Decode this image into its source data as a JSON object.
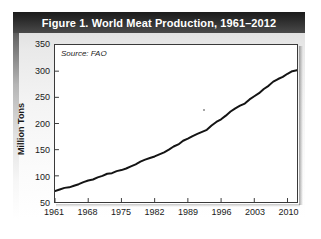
{
  "figure": {
    "title": "Figure 1. World Meat Production, 1961–2012",
    "source_note": "Source: FAO"
  },
  "chart_data": {
    "type": "line",
    "title": "Figure 1. World Meat Production, 1961–2012",
    "subtitle": "",
    "xlabel": "",
    "ylabel": "Million Tons",
    "annotations": [
      "Source: FAO"
    ],
    "grid": false,
    "legend": "none",
    "xlim": [
      1961,
      2012
    ],
    "ylim": [
      50,
      350
    ],
    "xticks": [
      1961,
      1968,
      1975,
      1982,
      1989,
      1996,
      2003,
      2010
    ],
    "xtick_labels": [
      "1961",
      "1968",
      "1975",
      "1982",
      "1989",
      "1996",
      "2003",
      "2010"
    ],
    "yticks": [
      50,
      100,
      150,
      200,
      250,
      300,
      350
    ],
    "ytick_labels": [
      "50",
      "100",
      "150",
      "200",
      "250",
      "300",
      "350"
    ],
    "line_color": "#141414",
    "series": [
      {
        "name": "World Meat Production",
        "units": "Million Tons",
        "x": [
          1961,
          1962,
          1963,
          1964,
          1965,
          1966,
          1967,
          1968,
          1969,
          1970,
          1971,
          1972,
          1973,
          1974,
          1975,
          1976,
          1977,
          1978,
          1979,
          1980,
          1981,
          1982,
          1983,
          1984,
          1985,
          1986,
          1987,
          1988,
          1989,
          1990,
          1991,
          1992,
          1993,
          1994,
          1995,
          1996,
          1997,
          1998,
          1999,
          2000,
          2001,
          2002,
          2003,
          2004,
          2005,
          2006,
          2007,
          2008,
          2009,
          2010,
          2011,
          2012
        ],
        "values": [
          71,
          74,
          77,
          78,
          81,
          84,
          88,
          91,
          93,
          97,
          100,
          104,
          105,
          109,
          111,
          114,
          118,
          122,
          127,
          131,
          134,
          137,
          141,
          145,
          150,
          156,
          160,
          167,
          171,
          176,
          180,
          184,
          188,
          196,
          203,
          208,
          215,
          223,
          229,
          234,
          238,
          246,
          252,
          258,
          266,
          272,
          280,
          285,
          289,
          295,
          300,
          302
        ]
      }
    ]
  },
  "axes": {
    "y_title": "Million Tons"
  }
}
